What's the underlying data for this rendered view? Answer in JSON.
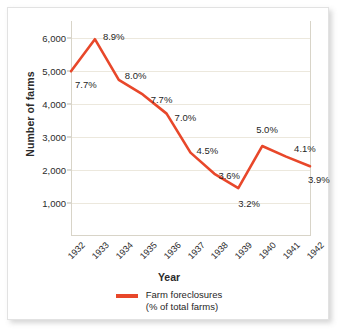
{
  "chart_data": {
    "type": "line",
    "title": "",
    "xlabel": "Year",
    "ylabel": "Number of farms",
    "ylim": [
      0,
      6500
    ],
    "yticks": [
      1000,
      2000,
      3000,
      4000,
      5000,
      6000
    ],
    "ytick_labels": [
      "1,000",
      "2,000",
      "3,000",
      "4,000",
      "5,000",
      "6,000"
    ],
    "grid": true,
    "legend_position": "bottom",
    "categories": [
      "1932",
      "1933",
      "1934",
      "1935",
      "1936",
      "1937",
      "1938",
      "1939",
      "1940",
      "1941",
      "1942"
    ],
    "series": [
      {
        "name": "Farm foreclosures",
        "color": "#e8472a",
        "values": [
          4980,
          5950,
          4720,
          4280,
          3700,
          2520,
          1880,
          1450,
          2720,
          2400,
          2110
        ],
        "point_labels": [
          "7.7%",
          "8.9%",
          "8.0%",
          "7.7%",
          "7.0%",
          "4.5%",
          "3.6%",
          "3.2%",
          "5.0%",
          "4.1%",
          "3.9%"
        ]
      }
    ],
    "legend": {
      "line1": "Farm foreclosures",
      "line2": "(% of total farms)"
    },
    "colors": {
      "line": "#e8472a",
      "grid": "#ece8dd",
      "axis": "#d8d4c8",
      "text": "#1f1f1f",
      "background": "#ffffff"
    }
  }
}
